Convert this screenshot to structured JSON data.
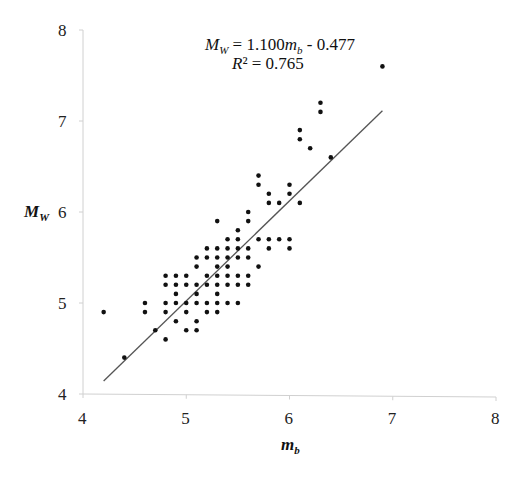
{
  "chart_data": {
    "type": "scatter",
    "title": "",
    "xlabel": "m_b",
    "ylabel": "M_W",
    "xlim": [
      4,
      8
    ],
    "ylim": [
      4,
      8
    ],
    "x_ticks": [
      "4",
      "5",
      "6",
      "7",
      "8"
    ],
    "y_ticks": [
      "4",
      "5",
      "6",
      "7",
      "8"
    ],
    "grid": false,
    "legend": null,
    "annotations": {
      "equation": "M_W = 1.100m_b - 0.477",
      "r_squared": "R² = 0.765"
    },
    "trendline": {
      "slope": 1.1,
      "intercept": -0.477,
      "x_start": 4.2,
      "x_end": 6.9
    },
    "series": [
      {
        "name": "observations",
        "points": [
          [
            4.2,
            4.9
          ],
          [
            4.4,
            4.4
          ],
          [
            4.6,
            5.0
          ],
          [
            4.6,
            4.9
          ],
          [
            4.7,
            4.7
          ],
          [
            4.8,
            5.3
          ],
          [
            4.8,
            5.2
          ],
          [
            4.8,
            5.0
          ],
          [
            4.8,
            4.9
          ],
          [
            4.8,
            4.6
          ],
          [
            4.9,
            5.3
          ],
          [
            4.9,
            5.2
          ],
          [
            4.9,
            5.1
          ],
          [
            4.9,
            5.0
          ],
          [
            4.9,
            4.8
          ],
          [
            5.0,
            5.3
          ],
          [
            5.0,
            5.2
          ],
          [
            5.0,
            5.0
          ],
          [
            5.0,
            4.9
          ],
          [
            5.0,
            4.7
          ],
          [
            5.1,
            5.5
          ],
          [
            5.1,
            5.4
          ],
          [
            5.1,
            5.2
          ],
          [
            5.1,
            5.1
          ],
          [
            5.1,
            5.0
          ],
          [
            5.1,
            4.8
          ],
          [
            5.1,
            4.7
          ],
          [
            5.2,
            5.6
          ],
          [
            5.2,
            5.5
          ],
          [
            5.2,
            5.3
          ],
          [
            5.2,
            5.2
          ],
          [
            5.2,
            5.0
          ],
          [
            5.2,
            4.9
          ],
          [
            5.3,
            5.9
          ],
          [
            5.3,
            5.6
          ],
          [
            5.3,
            5.5
          ],
          [
            5.3,
            5.4
          ],
          [
            5.3,
            5.3
          ],
          [
            5.3,
            5.2
          ],
          [
            5.3,
            5.1
          ],
          [
            5.3,
            5.0
          ],
          [
            5.3,
            4.9
          ],
          [
            5.4,
            5.7
          ],
          [
            5.4,
            5.6
          ],
          [
            5.4,
            5.5
          ],
          [
            5.4,
            5.4
          ],
          [
            5.4,
            5.3
          ],
          [
            5.4,
            5.2
          ],
          [
            5.4,
            5.0
          ],
          [
            5.5,
            5.8
          ],
          [
            5.5,
            5.7
          ],
          [
            5.5,
            5.6
          ],
          [
            5.5,
            5.5
          ],
          [
            5.5,
            5.3
          ],
          [
            5.5,
            5.2
          ],
          [
            5.5,
            5.0
          ],
          [
            5.6,
            6.0
          ],
          [
            5.6,
            5.9
          ],
          [
            5.6,
            5.6
          ],
          [
            5.6,
            5.5
          ],
          [
            5.6,
            5.3
          ],
          [
            5.6,
            5.2
          ],
          [
            5.7,
            6.4
          ],
          [
            5.7,
            6.3
          ],
          [
            5.7,
            5.7
          ],
          [
            5.7,
            5.4
          ],
          [
            5.8,
            6.2
          ],
          [
            5.8,
            6.1
          ],
          [
            5.8,
            5.7
          ],
          [
            5.8,
            5.6
          ],
          [
            5.9,
            6.1
          ],
          [
            5.9,
            5.7
          ],
          [
            6.0,
            6.3
          ],
          [
            6.0,
            6.2
          ],
          [
            6.0,
            5.7
          ],
          [
            6.0,
            5.6
          ],
          [
            6.1,
            6.9
          ],
          [
            6.1,
            6.8
          ],
          [
            6.1,
            6.1
          ],
          [
            6.2,
            6.7
          ],
          [
            6.3,
            7.2
          ],
          [
            6.3,
            7.1
          ],
          [
            6.4,
            6.6
          ],
          [
            6.9,
            7.6
          ]
        ]
      }
    ]
  }
}
